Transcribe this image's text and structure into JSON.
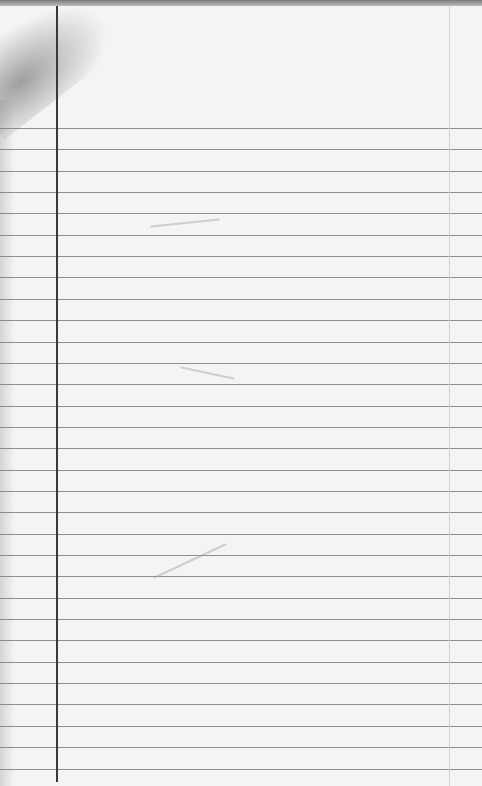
{
  "image": {
    "subject": "blank ruled notebook paper",
    "paper_color": "#f4f4f4",
    "rule_color": "#7c7c7c",
    "margin_line_color": "#3a3a3a",
    "rule_start_y": 128,
    "rule_spacing": 21.35,
    "rule_count": 31,
    "margin_x": 56,
    "right_margin_x": 449,
    "text_content": ""
  }
}
